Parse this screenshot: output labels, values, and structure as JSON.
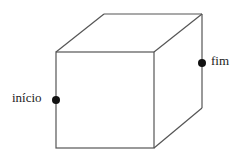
{
  "diagram": {
    "type": "cube-wireframe",
    "colors": {
      "edge": "#555555",
      "point": "#111111",
      "background": "#ffffff"
    },
    "points": [
      {
        "id": "start",
        "label": "início",
        "position": "midpoint of front-left vertical edge"
      },
      {
        "id": "end",
        "label": "fim",
        "position": "on back-right vertical edge, upper part"
      }
    ]
  }
}
